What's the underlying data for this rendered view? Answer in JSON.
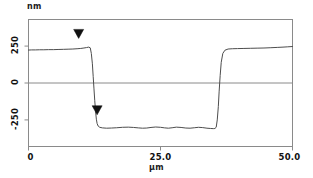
{
  "chart_data": {
    "type": "line",
    "title": "",
    "subtitle": "",
    "xlabel": "µm",
    "ylabel": "nm",
    "xlim": [
      0,
      50
    ],
    "ylim": [
      -430,
      430
    ],
    "grid": false,
    "legend": null,
    "xticks": [
      {
        "value": 0,
        "label": "0"
      },
      {
        "value": 25,
        "label": "25.0"
      },
      {
        "value": 50,
        "label": "50.0"
      }
    ],
    "yticks": [
      {
        "value": 250,
        "label": "250"
      },
      {
        "value": 0,
        "label": "0"
      },
      {
        "value": -250,
        "label": "-250"
      }
    ],
    "zero_line": 0,
    "series": [
      {
        "name": "surface profile",
        "color": "#4d4d4d",
        "x": [
          0.0,
          0.6,
          1.3,
          2.1,
          2.9,
          3.8,
          4.7,
          5.6,
          6.6,
          7.5,
          8.4,
          9.2,
          9.9,
          10.5,
          11.0,
          11.4,
          11.7,
          11.9,
          12.1,
          12.25,
          12.4,
          12.55,
          12.7,
          12.85,
          13.0,
          13.2,
          13.5,
          14.0,
          14.8,
          15.7,
          16.7,
          17.8,
          18.9,
          19.9,
          20.8,
          21.6,
          22.4,
          23.2,
          24.1,
          25.0,
          25.8,
          26.5,
          27.2,
          28.0,
          28.9,
          29.8,
          30.6,
          31.4,
          32.2,
          33.0,
          33.8,
          34.5,
          35.0,
          35.3,
          35.55,
          35.75,
          35.95,
          36.1,
          36.3,
          36.5,
          36.8,
          37.2,
          37.8,
          38.6,
          39.6,
          40.8,
          42.0,
          43.3,
          44.6,
          45.9,
          47.1,
          48.2,
          49.1,
          50.0
        ],
        "y": [
          223,
          224,
          224,
          225,
          225,
          226,
          226,
          227,
          228,
          229,
          230,
          232,
          234,
          237,
          240,
          243,
          238,
          200,
          130,
          45,
          -40,
          -120,
          -190,
          -245,
          -275,
          -292,
          -300,
          -304,
          -306,
          -305,
          -303,
          -300,
          -299,
          -301,
          -304,
          -306,
          -305,
          -301,
          -298,
          -300,
          -304,
          -306,
          -303,
          -299,
          -301,
          -305,
          -306,
          -303,
          -300,
          -302,
          -306,
          -308,
          -309,
          -308,
          -300,
          -250,
          -160,
          -60,
          50,
          140,
          200,
          222,
          230,
          232,
          233,
          234,
          235,
          236,
          237,
          239,
          241,
          243,
          245,
          247
        ]
      }
    ],
    "markers": [
      {
        "name": "upper-level-cursor",
        "shape": "triangle-down",
        "x": 9.5,
        "y": 302,
        "color": "#111111"
      },
      {
        "name": "lower-level-cursor",
        "shape": "triangle-down",
        "x": 13.0,
        "y": -215,
        "color": "#111111"
      }
    ]
  },
  "axes": {
    "y_unit_label": "nm",
    "x_unit_label": "µm",
    "frame_color": "#8a8a8a"
  }
}
